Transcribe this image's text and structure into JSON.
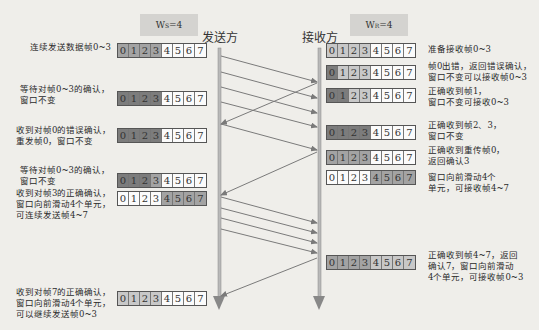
{
  "sender": {
    "window_label": {
      "prefix": "W",
      "sub": "S",
      "suffix": "=4"
    },
    "title": "发送方",
    "steps": [
      {
        "text": "连续发送数据帧0~3",
        "cells": [
          "mid",
          "mid",
          "mid",
          "mid",
          "white",
          "white",
          "white",
          "white"
        ]
      },
      {
        "text": "等待对帧0~3的确认，\n窗口不变",
        "cells": [
          "dark",
          "dark",
          "dark",
          "dark",
          "white",
          "white",
          "white",
          "white"
        ]
      },
      {
        "text": "收到对帧0的错误确认，\n重发帧0，窗口不变",
        "cells": [
          "dark",
          "dark",
          "dark",
          "dark",
          "white",
          "white",
          "white",
          "white"
        ]
      },
      {
        "text": "等待对帧0~3的确认，\n窗口不变",
        "cells": [
          "dark",
          "dark",
          "dark",
          "mid",
          "white",
          "white",
          "white",
          "white"
        ]
      },
      {
        "text": "收到对帧3的正确确认，\n窗口向前滑动4个单元，\n可连续发送帧4~7",
        "cells": [
          "white",
          "white",
          "white",
          "white",
          "mid",
          "mid",
          "mid",
          "mid"
        ]
      },
      {
        "text": "收到对帧7的正确确认，\n窗口向前滑动4个单元，\n可以继续发送帧0~3",
        "cells": [
          "light",
          "light",
          "light",
          "light",
          "white",
          "white",
          "white",
          "white"
        ]
      }
    ]
  },
  "receiver": {
    "window_label": {
      "prefix": "W",
      "sub": "R",
      "suffix": "=4"
    },
    "title": "接收方",
    "steps": [
      {
        "text": "准备接收帧0~3",
        "cells": [
          "light",
          "light",
          "light",
          "light",
          "white",
          "white",
          "white",
          "white"
        ]
      },
      {
        "text": "帧0出错，返回错误确认，\n窗口不变可以接收帧0~3",
        "cells": [
          "dark",
          "light",
          "light",
          "light",
          "white",
          "white",
          "white",
          "white"
        ]
      },
      {
        "text": "正确收到帧1，\n窗口不变可接收0~3",
        "cells": [
          "dark",
          "dark",
          "light",
          "light",
          "white",
          "white",
          "white",
          "white"
        ]
      },
      {
        "text": "正确收到帧2、3，\n窗口不变",
        "cells": [
          "dark",
          "dark",
          "dark",
          "dark",
          "white",
          "white",
          "white",
          "white"
        ]
      },
      {
        "text": "正确收到重传帧0，\n返回确认3",
        "cells": [
          "mid",
          "mid",
          "mid",
          "mid",
          "white",
          "white",
          "white",
          "white"
        ]
      },
      {
        "text": "窗口向前滑动4个\n单元，可接收帧4~7",
        "cells": [
          "white",
          "white",
          "white",
          "white",
          "mid",
          "mid",
          "mid",
          "mid"
        ]
      },
      {
        "text": "正确收到帧4~7，返回\n确认7，窗口向前滑动\n4个单元，可接收帧0~3",
        "cells": [
          "mid",
          "mid",
          "mid",
          "mid",
          "light",
          "light",
          "light",
          "light"
        ]
      }
    ]
  },
  "frame_numbers": [
    "0",
    "1",
    "2",
    "3",
    "4",
    "5",
    "6",
    "7"
  ],
  "colors": {
    "dark": "#7c7c7c",
    "mid": "#a3a3a3",
    "light": "#c8c8c8",
    "white": "#fbfbfb",
    "line": "#7a7a7a"
  },
  "messages": [
    {
      "from": "sender",
      "label": "frame-0"
    },
    {
      "from": "sender",
      "label": "frame-1"
    },
    {
      "from": "sender",
      "label": "frame-2"
    },
    {
      "from": "sender",
      "label": "frame-3"
    },
    {
      "from": "receiver",
      "label": "nak-0"
    },
    {
      "from": "sender",
      "label": "resend-frame-0"
    },
    {
      "from": "receiver",
      "label": "ack-3"
    },
    {
      "from": "sender",
      "label": "frame-4"
    },
    {
      "from": "sender",
      "label": "frame-5"
    },
    {
      "from": "sender",
      "label": "frame-6"
    },
    {
      "from": "sender",
      "label": "frame-7"
    },
    {
      "from": "receiver",
      "label": "ack-7"
    }
  ]
}
